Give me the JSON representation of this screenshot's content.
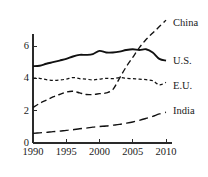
{
  "chart_data": {
    "type": "line",
    "title": "",
    "subtitle": "",
    "xlabel": "",
    "ylabel": "",
    "xlim": [
      1990,
      2010
    ],
    "ylim": [
      0,
      7.8
    ],
    "grid": false,
    "legend_position": "right-inline-labels",
    "x_ticks": [
      "1990",
      "1995",
      "2000",
      "2005",
      "2010"
    ],
    "x_tick_values": [
      1990,
      1995,
      2000,
      2005,
      2010
    ],
    "y_ticks": [
      "0",
      "2",
      "4",
      "6"
    ],
    "y_tick_values": [
      0,
      2,
      4,
      6
    ],
    "x": [
      1990,
      1991,
      1992,
      1993,
      1994,
      1995,
      1996,
      1997,
      1998,
      1999,
      2000,
      2001,
      2002,
      2003,
      2004,
      2005,
      2006,
      2007,
      2008,
      2009,
      2010
    ],
    "series": [
      {
        "name": "China",
        "label": "China",
        "line_style": "dashed-medium",
        "color": "#111111",
        "values": [
          2.2,
          2.45,
          2.65,
          2.85,
          3.0,
          3.15,
          3.2,
          3.1,
          3.0,
          3.0,
          3.05,
          3.1,
          3.3,
          4.0,
          4.7,
          5.3,
          5.9,
          6.4,
          6.8,
          7.2,
          7.6
        ],
        "label_x": 2011.2,
        "label_y": 7.45
      },
      {
        "name": "U.S.",
        "label": "U.S.",
        "line_style": "solid",
        "color": "#111111",
        "values": [
          4.75,
          4.78,
          4.9,
          5.0,
          5.1,
          5.2,
          5.35,
          5.45,
          5.45,
          5.5,
          5.7,
          5.6,
          5.6,
          5.65,
          5.75,
          5.8,
          5.75,
          5.8,
          5.6,
          5.2,
          5.1
        ],
        "label_x": 2011.2,
        "label_y": 5.1
      },
      {
        "name": "E.U.",
        "label": "E.U.",
        "line_style": "dashed-short",
        "color": "#111111",
        "values": [
          4.02,
          4.0,
          3.92,
          3.88,
          3.9,
          3.95,
          4.05,
          3.98,
          3.95,
          3.9,
          3.95,
          4.0,
          3.98,
          4.05,
          4.0,
          3.98,
          3.95,
          3.92,
          3.85,
          3.6,
          3.75
        ],
        "label_x": 2011.2,
        "label_y": 3.55
      },
      {
        "name": "India",
        "label": "India",
        "line_style": "dashed-long",
        "color": "#111111",
        "values": [
          0.6,
          0.63,
          0.66,
          0.7,
          0.73,
          0.78,
          0.82,
          0.88,
          0.92,
          0.98,
          1.02,
          1.05,
          1.1,
          1.15,
          1.22,
          1.3,
          1.4,
          1.52,
          1.65,
          1.8,
          1.9
        ],
        "label_x": 2011.2,
        "label_y": 2.0
      }
    ]
  },
  "axes": {
    "x_axis_name": "year-axis",
    "y_axis_name": "value-axis"
  }
}
